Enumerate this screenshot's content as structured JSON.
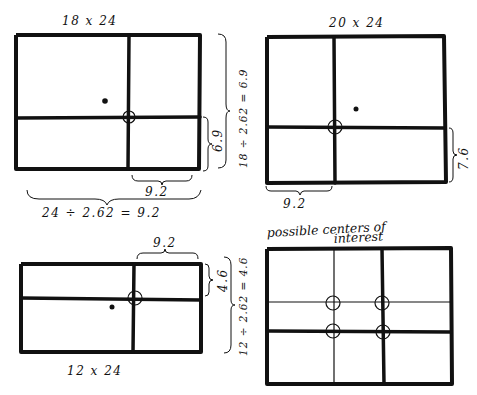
{
  "diagrams": [
    {
      "id": "panel-18x24",
      "title": "18 x 24",
      "dims": {
        "w": 24,
        "h": 18
      },
      "right_brace_label": "18 ÷ 2.62 = 6.9",
      "small_right_label": "6.9",
      "bottom_small_label": "9.2",
      "bottom_brace_label": "24 ÷ 2.62 = 9.2"
    },
    {
      "id": "panel-20x24",
      "title": "20 x 24",
      "dims": {
        "w": 24,
        "h": 20
      },
      "small_right_label": "7.6",
      "bottom_small_label": "9.2"
    },
    {
      "id": "panel-12x24",
      "title": "12 x 24",
      "dims": {
        "w": 24,
        "h": 12
      },
      "top_small_label": "9.2",
      "small_right_label": "4.6",
      "right_brace_label": "12 ÷ 2.62 = 4.6"
    },
    {
      "id": "panel-centers",
      "title": "possible centers of",
      "title_line2": "interest",
      "center_count": 4
    }
  ],
  "ratio": "2.62"
}
